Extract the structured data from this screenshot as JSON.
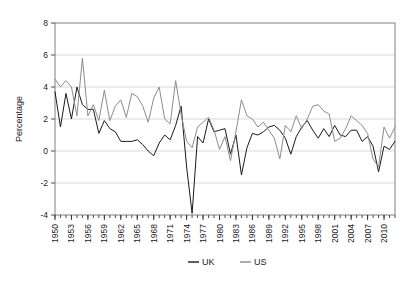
{
  "chart_data": {
    "type": "line",
    "title": "",
    "xlabel": "",
    "ylabel": "Percentage",
    "ylim": [
      -4,
      8
    ],
    "xlim": [
      1950,
      2012
    ],
    "yticks": [
      -4,
      -2,
      0,
      2,
      4,
      6,
      8
    ],
    "ytick_labels": [
      "-4",
      "-2",
      "0",
      "2",
      "4",
      "6",
      "8"
    ],
    "xtick_labels": [
      "1950",
      "1953",
      "1956",
      "1959",
      "1962",
      "1965",
      "1968",
      "1971",
      "1974",
      "1977",
      "1980",
      "1983",
      "1986",
      "1989",
      "1992",
      "1995",
      "1998",
      "2001",
      "2004",
      "2007",
      "2010"
    ],
    "xtick_values": [
      1950,
      1953,
      1956,
      1959,
      1962,
      1965,
      1968,
      1971,
      1974,
      1977,
      1980,
      1983,
      1986,
      1989,
      1992,
      1995,
      1998,
      2001,
      2004,
      2007,
      2010
    ],
    "minor_xticks_every": 1,
    "grid": "horizontal",
    "legend_position": "bottom",
    "x": [
      1950,
      1951,
      1952,
      1953,
      1954,
      1955,
      1956,
      1957,
      1958,
      1959,
      1960,
      1961,
      1962,
      1963,
      1964,
      1965,
      1966,
      1967,
      1968,
      1969,
      1970,
      1971,
      1972,
      1973,
      1974,
      1975,
      1976,
      1977,
      1978,
      1979,
      1980,
      1981,
      1982,
      1983,
      1984,
      1985,
      1986,
      1987,
      1988,
      1989,
      1990,
      1991,
      1992,
      1993,
      1994,
      1995,
      1996,
      1997,
      1998,
      1999,
      2000,
      2001,
      2002,
      2003,
      2004,
      2005,
      2006,
      2007,
      2008,
      2009,
      2010,
      2011,
      2012
    ],
    "series": [
      {
        "name": "UK",
        "color": "#1a1a1a",
        "values": [
          3.7,
          1.5,
          3.6,
          2.0,
          4.0,
          2.9,
          2.6,
          2.6,
          1.1,
          1.9,
          1.4,
          1.2,
          0.6,
          0.6,
          0.6,
          0.7,
          0.4,
          0.0,
          -0.3,
          0.5,
          1.0,
          0.7,
          1.6,
          2.8,
          -1.0,
          -3.9,
          0.9,
          0.5,
          2.0,
          1.2,
          1.3,
          1.4,
          -0.2,
          1.0,
          -1.5,
          0.2,
          1.1,
          1.0,
          1.2,
          1.5,
          1.6,
          1.3,
          0.8,
          -0.2,
          0.9,
          1.5,
          1.9,
          1.3,
          0.8,
          1.4,
          0.9,
          1.6,
          1.0,
          0.9,
          1.3,
          1.3,
          0.6,
          0.9,
          0.3,
          -1.3,
          0.3,
          0.1,
          0.6
        ]
      },
      {
        "name": "US",
        "color": "#8c8c8c",
        "values": [
          4.5,
          4.0,
          4.4,
          4.0,
          2.2,
          5.8,
          2.2,
          2.9,
          1.9,
          3.8,
          1.9,
          2.8,
          3.2,
          2.1,
          3.6,
          3.4,
          2.8,
          1.8,
          3.3,
          4.0,
          2.0,
          1.7,
          4.4,
          2.3,
          0.6,
          0.2,
          1.5,
          1.8,
          2.1,
          1.3,
          0.1,
          0.9,
          -0.6,
          1.2,
          3.2,
          2.2,
          2.0,
          1.5,
          1.8,
          1.3,
          0.8,
          -0.5,
          1.6,
          1.2,
          2.2,
          1.4,
          2.0,
          2.8,
          2.9,
          2.5,
          2.3,
          0.6,
          0.8,
          1.4,
          2.2,
          1.9,
          1.6,
          1.1,
          -0.5,
          -1.0,
          1.5,
          0.8,
          1.5
        ]
      }
    ]
  },
  "legend": {
    "items": [
      {
        "label": "UK",
        "color": "#1a1a1a"
      },
      {
        "label": "US",
        "color": "#8c8c8c"
      }
    ]
  },
  "axes": {
    "y_axis_title": "Percentage"
  }
}
